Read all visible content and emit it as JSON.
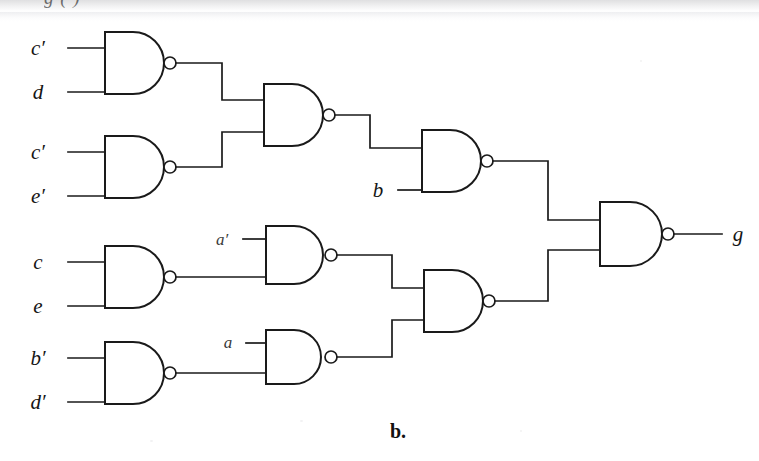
{
  "figure": {
    "caption": "b.",
    "clipped_header_text": "g    ( )",
    "output_label": "g"
  },
  "colors": {
    "ink": "#1a1a1a",
    "paper": "#ffffff",
    "label": "#151515",
    "small_label": "#3a3a3a"
  },
  "inputs": [
    {
      "id": "in-c-prime-1",
      "label": "c′",
      "x": 46,
      "y": 48
    },
    {
      "id": "in-d",
      "label": "d",
      "x": 46,
      "y": 92
    },
    {
      "id": "in-c-prime-2",
      "label": "c′",
      "x": 46,
      "y": 152
    },
    {
      "id": "in-e-prime",
      "label": "e′",
      "x": 46,
      "y": 196
    },
    {
      "id": "in-c",
      "label": "c",
      "x": 46,
      "y": 262
    },
    {
      "id": "in-e",
      "label": "e",
      "x": 46,
      "y": 306
    },
    {
      "id": "in-b-prime",
      "label": "b′",
      "x": 46,
      "y": 358
    },
    {
      "id": "in-d-prime",
      "label": "d′",
      "x": 46,
      "y": 402
    },
    {
      "id": "in-b",
      "label": "b",
      "x": 378,
      "y": 194
    },
    {
      "id": "in-a-prime",
      "label": "a′",
      "x": 222,
      "y": 243
    },
    {
      "id": "in-a",
      "label": "a",
      "x": 226,
      "y": 345
    }
  ],
  "gates": [
    {
      "id": "gate-cd",
      "type": "NAND",
      "label": "c′ · d",
      "inputs": [
        "c′",
        "d"
      ]
    },
    {
      "id": "gate-ce",
      "type": "NAND",
      "label": "c′ · e′",
      "inputs": [
        "c′",
        "e′"
      ]
    },
    {
      "id": "gate-merge-top",
      "type": "NAND",
      "label": "merge-top",
      "inputs": [
        "gate-cd",
        "gate-ce"
      ]
    },
    {
      "id": "gate-b",
      "type": "NAND",
      "label": "b-stage",
      "inputs": [
        "gate-merge-top",
        "b"
      ]
    },
    {
      "id": "gate-ce2",
      "type": "NAND",
      "label": "c · e",
      "inputs": [
        "c",
        "e"
      ]
    },
    {
      "id": "gate-aprime",
      "type": "NAND",
      "label": "a′-stage",
      "inputs": [
        "a′",
        "gate-ce2"
      ]
    },
    {
      "id": "gate-bd",
      "type": "NAND",
      "label": "b′ · d′",
      "inputs": [
        "b′",
        "d′"
      ]
    },
    {
      "id": "gate-a",
      "type": "NAND",
      "label": "a-stage",
      "inputs": [
        "a",
        "gate-bd"
      ]
    },
    {
      "id": "gate-merge-bot",
      "type": "NAND",
      "label": "merge-bottom",
      "inputs": [
        "gate-aprime",
        "gate-a"
      ]
    },
    {
      "id": "gate-output",
      "type": "NAND",
      "label": "output",
      "inputs": [
        "gate-b",
        "gate-merge-bot"
      ]
    }
  ],
  "geometry": {
    "gate_w": 56,
    "gate_h": 62,
    "bubble_r": 6,
    "boxes": {
      "gate-cd": {
        "x": 105,
        "y": 32,
        "h": 62
      },
      "gate-ce": {
        "x": 105,
        "y": 136,
        "h": 62
      },
      "gate-merge-top": {
        "x": 264,
        "y": 84,
        "h": 62
      },
      "gate-b": {
        "x": 422,
        "y": 130,
        "h": 62
      },
      "gate-ce2": {
        "x": 105,
        "y": 246,
        "h": 62
      },
      "gate-aprime": {
        "x": 266,
        "y": 226,
        "h": 58
      },
      "gate-bd": {
        "x": 105,
        "y": 342,
        "h": 62
      },
      "gate-a": {
        "x": 266,
        "y": 330,
        "h": 54
      },
      "gate-merge-bot": {
        "x": 424,
        "y": 270,
        "h": 62
      },
      "gate-output": {
        "x": 600,
        "y": 202,
        "h": 64
      }
    }
  }
}
